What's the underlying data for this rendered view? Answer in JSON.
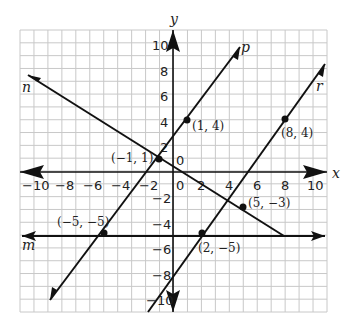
{
  "graph": {
    "axis_labels": {
      "x": "x",
      "y": "y"
    },
    "x_ticks": [
      "−10",
      "−8",
      "−6",
      "−4",
      "−2",
      "0",
      "2",
      "4",
      "6",
      "8",
      "10"
    ],
    "y_ticks_pos": [
      "10",
      "8",
      "6",
      "4",
      "2"
    ],
    "y_ticks_neg": [
      "−2",
      "−4",
      "−6",
      "−8",
      "−10"
    ],
    "lines": {
      "m": {
        "label": "m",
        "desc": "y = -5"
      },
      "n": {
        "label": "n",
        "desc": "through (-1,1) and (5,-3)"
      },
      "p": {
        "label": "p",
        "desc": "through (-5,-5), (-1,1), (1,4)"
      },
      "r": {
        "label": "r",
        "desc": "through (2,-5) and (8,4)"
      }
    },
    "points": [
      {
        "label": "(−1, 1)"
      },
      {
        "label": "(1, 4)"
      },
      {
        "label": "(8, 4)"
      },
      {
        "label": "(5, −3)"
      },
      {
        "label": "(−5, −5)"
      },
      {
        "label": "(2, −5)"
      }
    ],
    "colors": {
      "grid": "#c8c8c8",
      "line": "#111111",
      "background": "#ffffff"
    }
  },
  "chart_data": {
    "type": "line",
    "title": "",
    "xlabel": "x",
    "ylabel": "y",
    "xlim": [
      -11,
      11
    ],
    "ylim": [
      -11,
      11
    ],
    "grid": true,
    "series": [
      {
        "name": "m",
        "points": [
          [
            -11,
            -5
          ],
          [
            11,
            -5
          ]
        ]
      },
      {
        "name": "n",
        "points": [
          [
            -10,
            7.67
          ],
          [
            8,
            -5
          ]
        ]
      },
      {
        "name": "p",
        "points": [
          [
            -9,
            -11
          ],
          [
            5,
            10
          ]
        ]
      },
      {
        "name": "r",
        "points": [
          [
            -2,
            -11
          ],
          [
            10,
            7
          ]
        ]
      }
    ],
    "labeled_points": [
      [
        -1,
        1
      ],
      [
        1,
        4
      ],
      [
        8,
        4
      ],
      [
        5,
        -3
      ],
      [
        -5,
        -5
      ],
      [
        2,
        -5
      ]
    ]
  }
}
